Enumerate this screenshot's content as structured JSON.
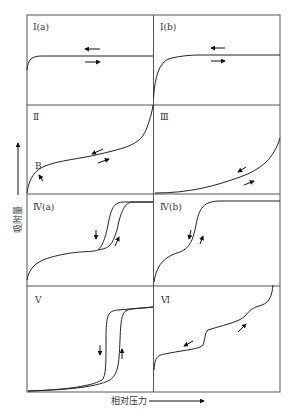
{
  "figure": {
    "type": "adsorption-isotherm-classification",
    "y_axis_label": "吸附量",
    "x_axis_label": "相对压力",
    "point_label_B": "B",
    "panels": [
      {
        "id": "Ia",
        "label": "Ⅰ(a)"
      },
      {
        "id": "Ib",
        "label": "Ⅰ(b)"
      },
      {
        "id": "II",
        "label": "Ⅱ"
      },
      {
        "id": "III",
        "label": "Ⅲ"
      },
      {
        "id": "IVa",
        "label": "Ⅳ(a)"
      },
      {
        "id": "IVb",
        "label": "Ⅳ(b)"
      },
      {
        "id": "V",
        "label": "Ⅴ"
      },
      {
        "id": "VI",
        "label": "Ⅵ"
      }
    ]
  }
}
